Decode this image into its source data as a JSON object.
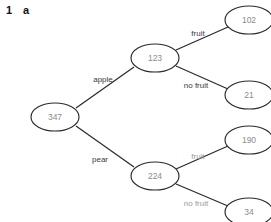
{
  "header": {
    "number": "1",
    "letter": "a"
  },
  "colors": {
    "node_stroke": "#2b2b2b",
    "node_fill": "#ffffff",
    "node_text": "#8c8c8c",
    "edge_line": "#2b2b2b",
    "edge_label_dark": "#3a3a3a",
    "edge_label_light": "#9a9a9a",
    "background": "#ffffff"
  },
  "diagram": {
    "type": "tree",
    "nodes": [
      {
        "id": "root",
        "label": "347",
        "cx": 55,
        "cy": 117,
        "rx": 24,
        "ry": 14
      },
      {
        "id": "apple",
        "label": "123",
        "cx": 155,
        "cy": 58,
        "rx": 24,
        "ry": 14
      },
      {
        "id": "pear",
        "label": "224",
        "cx": 155,
        "cy": 176,
        "rx": 24,
        "ry": 14
      },
      {
        "id": "apple-fruit",
        "label": "102",
        "cx": 249,
        "cy": 20,
        "rx": 24,
        "ry": 14
      },
      {
        "id": "apple-nofruit",
        "label": "21",
        "cx": 249,
        "cy": 95,
        "rx": 24,
        "ry": 14
      },
      {
        "id": "pear-fruit",
        "label": "190",
        "cx": 249,
        "cy": 140,
        "rx": 24,
        "ry": 14
      },
      {
        "id": "pear-nofruit",
        "label": "34",
        "cx": 249,
        "cy": 212,
        "rx": 24,
        "ry": 14
      }
    ],
    "edges": [
      {
        "id": "root-apple",
        "from": "root",
        "to": "apple",
        "label": "apple",
        "label_x": 103,
        "label_y": 79,
        "tone": "dark",
        "x1": 76,
        "y1": 108,
        "x2": 134,
        "y2": 67
      },
      {
        "id": "root-pear",
        "from": "root",
        "to": "pear",
        "label": "pear",
        "label_x": 100,
        "label_y": 159,
        "tone": "dark",
        "x1": 76,
        "y1": 126,
        "x2": 134,
        "y2": 167
      },
      {
        "id": "apple-fruit-edge",
        "from": "apple",
        "to": "apple-fruit",
        "label": "fruit",
        "label_x": 198,
        "label_y": 33,
        "tone": "dark",
        "x1": 176,
        "y1": 50,
        "x2": 228,
        "y2": 27
      },
      {
        "id": "apple-nofruit-edge",
        "from": "apple",
        "to": "apple-nofruit",
        "label": "no fruit",
        "label_x": 196,
        "label_y": 85,
        "tone": "dark",
        "x1": 176,
        "y1": 66,
        "x2": 228,
        "y2": 89
      },
      {
        "id": "pear-fruit-edge",
        "from": "pear",
        "to": "pear-fruit",
        "label": "fruit",
        "label_x": 198,
        "label_y": 156,
        "tone": "light",
        "x1": 176,
        "y1": 169,
        "x2": 228,
        "y2": 146
      },
      {
        "id": "pear-nofruit-edge",
        "from": "pear",
        "to": "pear-nofruit",
        "label": "no fruit",
        "label_x": 196,
        "label_y": 203,
        "tone": "light",
        "x1": 176,
        "y1": 184,
        "x2": 228,
        "y2": 206
      }
    ]
  }
}
